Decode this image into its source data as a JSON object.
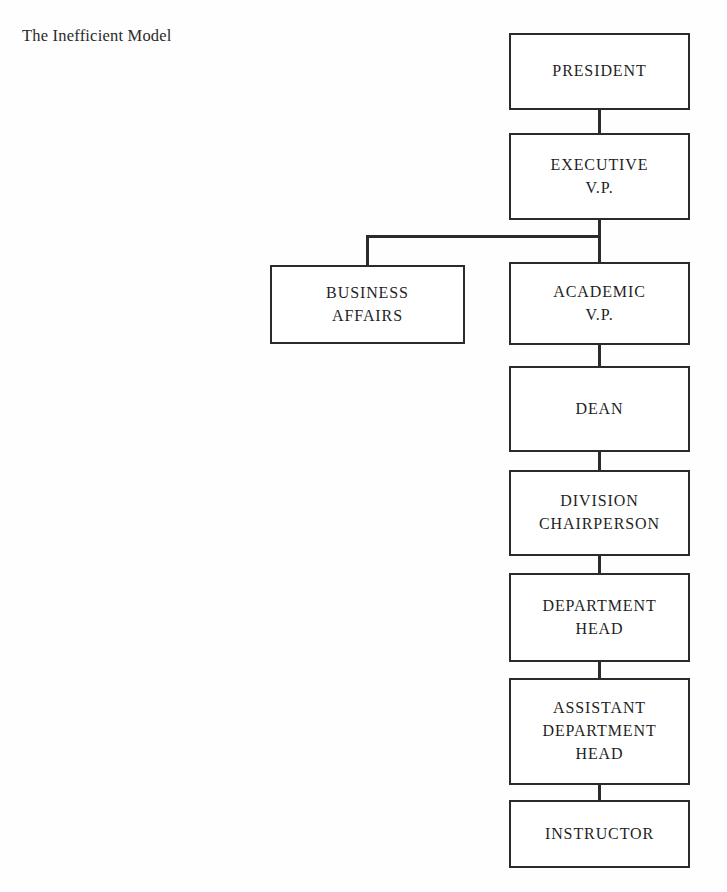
{
  "title": "The Inefficient Model",
  "diagram": {
    "type": "organizational-chart",
    "orientation": "vertical",
    "line_color": "#2b2b2b",
    "box_fill": "#ffffff",
    "background": "#fefefe",
    "nodes": [
      {
        "id": "president",
        "label": "PRESIDENT",
        "level": 1,
        "x": 509,
        "y": 33,
        "w": 181,
        "h": 77
      },
      {
        "id": "executive-vp",
        "label": "EXECUTIVE\nV.P.",
        "level": 2,
        "x": 509,
        "y": 133,
        "w": 181,
        "h": 87
      },
      {
        "id": "business-affairs",
        "label": "BUSINESS\nAFFAIRS",
        "level": 3,
        "x": 270,
        "y": 265,
        "w": 195,
        "h": 79
      },
      {
        "id": "academic-vp",
        "label": "ACADEMIC\nV.P.",
        "level": 3,
        "x": 509,
        "y": 262,
        "w": 181,
        "h": 83
      },
      {
        "id": "dean",
        "label": "DEAN",
        "level": 4,
        "x": 509,
        "y": 366,
        "w": 181,
        "h": 86
      },
      {
        "id": "division-chair",
        "label": "DIVISION\nCHAIRPERSON",
        "level": 5,
        "x": 509,
        "y": 470,
        "w": 181,
        "h": 86
      },
      {
        "id": "department-head",
        "label": "DEPARTMENT\nHEAD",
        "level": 6,
        "x": 509,
        "y": 573,
        "w": 181,
        "h": 89
      },
      {
        "id": "asst-dept-head",
        "label": "ASSISTANT\nDEPARTMENT\nHEAD",
        "level": 7,
        "x": 509,
        "y": 678,
        "w": 181,
        "h": 107
      },
      {
        "id": "instructor",
        "label": "INSTRUCTOR",
        "level": 8,
        "x": 509,
        "y": 800,
        "w": 181,
        "h": 68
      }
    ],
    "connectors": [
      {
        "id": "president-to-executive-vp",
        "from": "president",
        "to": "executive-vp",
        "kind": "vertical",
        "x": 598,
        "y": 110,
        "w": 3,
        "h": 23
      },
      {
        "id": "executive-vp-stem",
        "from": "executive-vp",
        "to": "branch",
        "kind": "vertical",
        "x": 598,
        "y": 220,
        "w": 3,
        "h": 42
      },
      {
        "id": "branch-horizontal",
        "from": "executive-vp",
        "to": "business-affairs",
        "kind": "horizontal",
        "x": 366,
        "y": 235,
        "w": 234,
        "h": 3
      },
      {
        "id": "branch-to-business-affairs",
        "from": "branch",
        "to": "business-affairs",
        "kind": "vertical",
        "x": 366,
        "y": 235,
        "w": 3,
        "h": 31
      },
      {
        "id": "academic-vp-to-dean",
        "from": "academic-vp",
        "to": "dean",
        "kind": "vertical",
        "x": 598,
        "y": 345,
        "w": 3,
        "h": 22
      },
      {
        "id": "dean-to-division-chair",
        "from": "dean",
        "to": "division-chair",
        "kind": "vertical",
        "x": 598,
        "y": 452,
        "w": 3,
        "h": 19
      },
      {
        "id": "division-chair-to-dept-head",
        "from": "division-chair",
        "to": "department-head",
        "kind": "vertical",
        "x": 598,
        "y": 556,
        "w": 3,
        "h": 18
      },
      {
        "id": "dept-head-to-asst-dept-head",
        "from": "department-head",
        "to": "asst-dept-head",
        "kind": "vertical",
        "x": 598,
        "y": 662,
        "w": 3,
        "h": 17
      },
      {
        "id": "asst-dept-head-to-instructor",
        "from": "asst-dept-head",
        "to": "instructor",
        "kind": "vertical",
        "x": 598,
        "y": 785,
        "w": 3,
        "h": 16
      }
    ]
  }
}
